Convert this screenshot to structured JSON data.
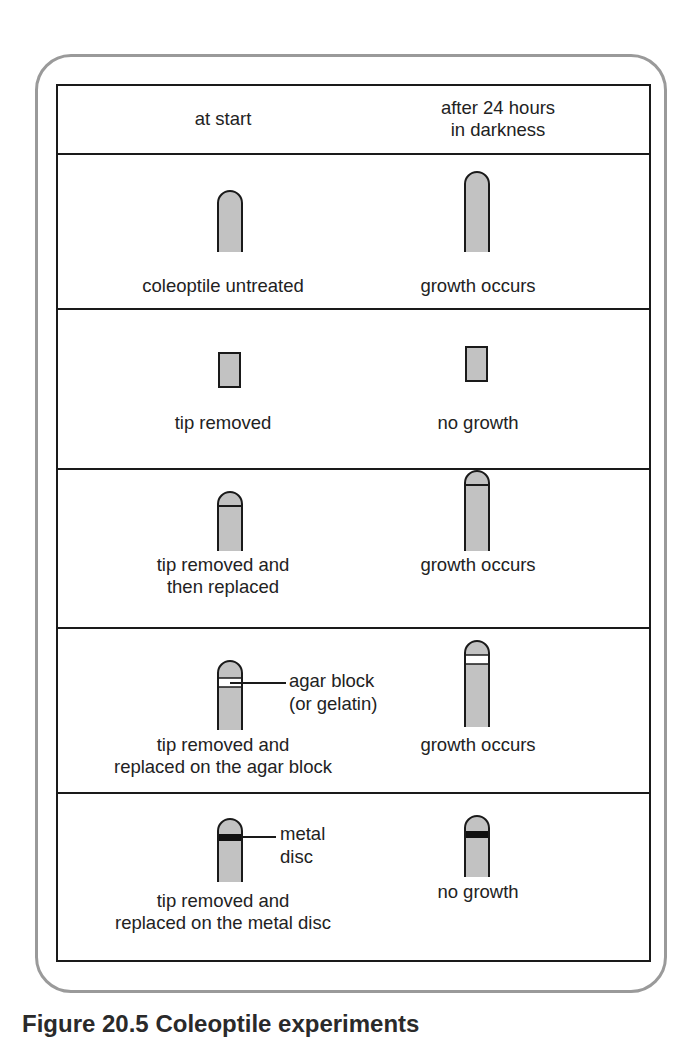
{
  "figure": {
    "header": {
      "col1": "at start",
      "col2_line1": "after 24 hours",
      "col2_line2": "in darkness"
    },
    "rows": [
      {
        "id": "untreated",
        "start_label": [
          "coleoptile untreated"
        ],
        "result_label": "growth occurs",
        "start_shape": "intact-coleoptile",
        "result_shape": "taller-intact-coleoptile"
      },
      {
        "id": "tip-removed",
        "start_label": [
          "tip removed"
        ],
        "result_label": "no growth",
        "start_shape": "decapitated-stump",
        "result_shape": "decapitated-stump"
      },
      {
        "id": "tip-replaced",
        "start_label": [
          "tip removed and",
          "then replaced"
        ],
        "result_label": "growth occurs",
        "start_shape": "coleoptile-with-replaced-tip",
        "result_shape": "taller-coleoptile-with-replaced-tip"
      },
      {
        "id": "agar-block",
        "start_label": [
          "tip removed and",
          "replaced on the agar block"
        ],
        "result_label": "growth occurs",
        "annotation": [
          "agar block",
          "(or gelatin)"
        ],
        "start_shape": "coleoptile-with-agar-block",
        "result_shape": "taller-coleoptile-with-agar-block"
      },
      {
        "id": "metal-disc",
        "start_label": [
          "tip removed and",
          "replaced on the metal disc"
        ],
        "result_label": "no growth",
        "annotation": [
          "metal",
          "disc"
        ],
        "start_shape": "coleoptile-with-metal-disc",
        "result_shape": "coleoptile-with-metal-disc"
      }
    ],
    "caption": {
      "number": "Figure 20.5",
      "title": "Coleoptile experiments"
    },
    "colors": {
      "frame": "#9a9a9a",
      "table_border": "#1a1a1a",
      "coleoptile_fill": "#c2c2c2",
      "agar_fill": "#ffffff",
      "metal_fill": "#111111"
    }
  }
}
